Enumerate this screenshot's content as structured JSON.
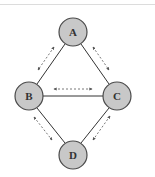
{
  "diagram": {
    "type": "network-graph",
    "colors": {
      "node_fill": "#c8c8c8",
      "node_stroke": "#4a4a4a",
      "edge": "#333333",
      "arrow": "#555555",
      "top_rule": "#dcdcdc"
    },
    "nodes": [
      {
        "id": "A",
        "label": "A",
        "cx": 73,
        "cy": 32
      },
      {
        "id": "B",
        "label": "B",
        "cx": 29,
        "cy": 96
      },
      {
        "id": "C",
        "label": "C",
        "cx": 117,
        "cy": 96
      },
      {
        "id": "D",
        "label": "D",
        "cx": 73,
        "cy": 155
      }
    ],
    "edges": [
      {
        "from": "A",
        "to": "B",
        "style": "solid"
      },
      {
        "from": "A",
        "to": "C",
        "style": "solid"
      },
      {
        "from": "B",
        "to": "C",
        "style": "solid"
      },
      {
        "from": "B",
        "to": "D",
        "style": "solid"
      },
      {
        "from": "C",
        "to": "D",
        "style": "solid"
      }
    ],
    "arrows": [
      {
        "between": [
          "A",
          "B"
        ],
        "style": "dashed",
        "direction": "bidirectional"
      },
      {
        "between": [
          "A",
          "C"
        ],
        "style": "dashed",
        "direction": "bidirectional"
      },
      {
        "between": [
          "B",
          "C"
        ],
        "style": "dashed",
        "direction": "bidirectional"
      },
      {
        "between": [
          "B",
          "D"
        ],
        "style": "dashed",
        "direction": "bidirectional"
      },
      {
        "between": [
          "C",
          "D"
        ],
        "style": "dashed",
        "direction": "bidirectional"
      }
    ]
  }
}
